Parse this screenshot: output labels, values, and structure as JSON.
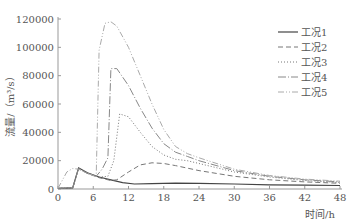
{
  "chart_data": {
    "type": "line",
    "title": "",
    "xlabel": "时间/h",
    "ylabel": "流量/（m³/s）",
    "xlim": [
      0,
      48
    ],
    "ylim": [
      0,
      120000
    ],
    "xticks": [
      0,
      6,
      12,
      18,
      24,
      30,
      36,
      42,
      48
    ],
    "yticks": [
      0,
      20000,
      40000,
      60000,
      80000,
      100000,
      120000
    ],
    "grid": false,
    "legend_position": "upper right",
    "series": [
      {
        "name": "工况1",
        "style": "solid",
        "x": [
          0,
          2.5,
          3.5,
          5,
          7,
          9,
          11,
          13,
          16,
          20,
          24,
          30,
          36,
          42,
          48
        ],
        "y": [
          500,
          800,
          15000,
          11500,
          8500,
          6500,
          4500,
          3500,
          3800,
          4200,
          4000,
          3500,
          3000,
          2700,
          2500
        ]
      },
      {
        "name": "工况2",
        "style": "dashed",
        "x": [
          0,
          2.5,
          3.5,
          5,
          7,
          9,
          10,
          12,
          14,
          16,
          18,
          20,
          24,
          30,
          36,
          42,
          48
        ],
        "y": [
          500,
          800,
          14500,
          11000,
          8000,
          6000,
          6500,
          12000,
          17000,
          18500,
          18000,
          16500,
          13000,
          9000,
          6500,
          5000,
          4000
        ]
      },
      {
        "name": "工况3",
        "style": "dotted",
        "x": [
          0,
          2.5,
          3.5,
          5,
          7,
          8.5,
          9.5,
          10.5,
          12,
          14,
          16,
          18,
          20,
          22,
          24,
          30,
          36,
          42,
          48
        ],
        "y": [
          500,
          800,
          14500,
          11000,
          8500,
          9000,
          20000,
          53000,
          51000,
          40000,
          30000,
          24000,
          21000,
          20000,
          18000,
          12000,
          8500,
          6000,
          4500
        ]
      },
      {
        "name": "工况4",
        "style": "dashdot",
        "x": [
          0,
          2.5,
          3.5,
          5,
          6.5,
          7.5,
          8.5,
          9,
          10,
          12,
          14,
          16,
          18,
          20,
          22,
          24,
          30,
          36,
          42,
          48
        ],
        "y": [
          500,
          800,
          14500,
          11000,
          9000,
          14000,
          22000,
          85000,
          85000,
          73000,
          57000,
          43000,
          32000,
          26000,
          23000,
          20000,
          13000,
          9000,
          6500,
          5000
        ]
      },
      {
        "name": "工况5",
        "style": "dashdotdot",
        "x": [
          0,
          1.5,
          2.5,
          3.5,
          5,
          6.5,
          7,
          8,
          9,
          10,
          12,
          14,
          16,
          18,
          20,
          22,
          24,
          30,
          36,
          42,
          48
        ],
        "y": [
          500,
          12000,
          14500,
          14000,
          11000,
          9000,
          98000,
          117000,
          118000,
          115000,
          100000,
          80000,
          60000,
          42000,
          30000,
          25000,
          22000,
          14000,
          9500,
          7000,
          5500
        ]
      }
    ]
  }
}
